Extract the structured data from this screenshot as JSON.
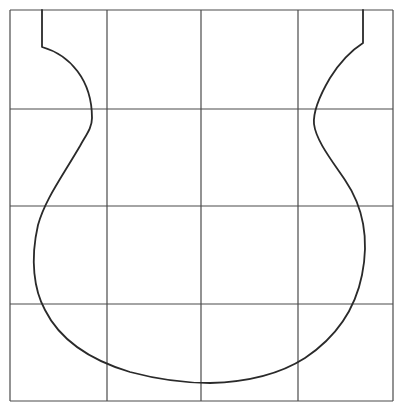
{
  "figure": {
    "width": 404,
    "height": 414,
    "colors": {
      "background": "#ffffff",
      "grid": "#4a4a4a",
      "outline": "#2a2a2a"
    },
    "grid": {
      "rows": 4,
      "cols": 4,
      "x_lines": [
        10,
        107,
        201,
        298,
        393
      ],
      "y_lines": [
        10,
        109,
        206,
        304,
        401
      ]
    },
    "shape": {
      "name": "vase-outline",
      "path": "M 42 10 L 42 47 C 70 55, 92 80, 92 118 C 92 128, 86 135, 80 146 C 60 180, 45 200, 38 225 C 30 260, 34 290, 45 310 C 60 340, 90 360, 130 372 C 160 380, 185 383, 210 383 C 250 382, 280 374, 305 358 C 335 338, 355 310, 362 275 C 370 235, 362 205, 345 180 C 330 158, 316 140, 314 124 C 313 112, 320 95, 330 78 C 340 62, 352 50, 363 43 L 363 10"
    }
  }
}
